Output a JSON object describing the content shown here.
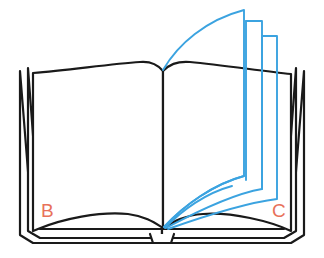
{
  "illustration": {
    "title": "Open book with flipping pages diagram",
    "background_color": "#ffffff"
  },
  "book": {
    "outline_color": "#1a1a1a",
    "outline_width": 2.2,
    "cover_color": "#ffffff",
    "page_color": "#ffffff",
    "name": "open-book"
  },
  "flipping_pages": {
    "color": "#3ba3e0",
    "stroke_width": 1.9,
    "count": 3,
    "description": "Three turning pages arcing from the spine up and over to the right"
  },
  "labels": {
    "color": "#e8715a",
    "left": {
      "text": "B",
      "name": "left-page-label"
    },
    "right": {
      "text": "C",
      "name": "right-page-label"
    }
  }
}
